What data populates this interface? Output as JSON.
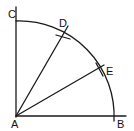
{
  "diagram": {
    "stroke_color": "#1a1a1a",
    "background": "#ffffff",
    "points": {
      "A": {
        "label": "A",
        "x": 16,
        "y": 116
      },
      "B": {
        "label": "B",
        "x": 114,
        "y": 116
      },
      "C": {
        "label": "C",
        "x": 16,
        "y": 21
      },
      "D": {
        "label": "D",
        "x": 63,
        "y": 34
      },
      "E": {
        "label": "E",
        "x": 99,
        "y": 69
      }
    },
    "labels": {
      "A": "A",
      "B": "B",
      "C": "C",
      "D": "D",
      "E": "E"
    },
    "arc": {
      "center": "A",
      "radius": 95,
      "from": "C",
      "to": "B"
    },
    "lines": [
      {
        "from": "A",
        "to": "C",
        "extended": true
      },
      {
        "from": "A",
        "to": "B",
        "extended": true
      },
      {
        "from": "A",
        "to": "D"
      },
      {
        "from": "A",
        "to": "E"
      }
    ]
  }
}
